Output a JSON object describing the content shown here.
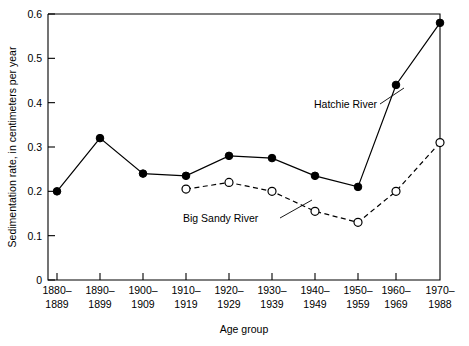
{
  "chart_data": {
    "type": "line",
    "title": "",
    "xlabel": "Age group",
    "ylabel": "Sedimentation rate, in centimeters per year",
    "categories": [
      "1880–1889",
      "1890–1899",
      "1900–1909",
      "1910–1919",
      "1920–1929",
      "1930–1939",
      "1940–1949",
      "1950–1959",
      "1960–1969",
      "1970–1988"
    ],
    "category_lines": [
      [
        "1880–",
        "1889"
      ],
      [
        "1890–",
        "1899"
      ],
      [
        "1900–",
        "1909"
      ],
      [
        "1910–",
        "1919"
      ],
      [
        "1920–",
        "1929"
      ],
      [
        "1930–",
        "1939"
      ],
      [
        "1940–",
        "1949"
      ],
      [
        "1950–",
        "1959"
      ],
      [
        "1960–",
        "1969"
      ],
      [
        "1970–",
        "1988"
      ]
    ],
    "series": [
      {
        "name": "Hatchie River",
        "marker": "filled-circle",
        "line_style": "solid",
        "values": [
          0.2,
          0.32,
          0.24,
          0.235,
          0.28,
          0.275,
          0.235,
          0.21,
          0.44,
          0.58
        ]
      },
      {
        "name": "Big Sandy River",
        "marker": "open-circle",
        "line_style": "dashed",
        "values": [
          null,
          null,
          null,
          0.205,
          0.22,
          0.2,
          0.155,
          0.13,
          0.2,
          0.31
        ]
      }
    ],
    "ylim": [
      0,
      0.6
    ],
    "yticks": [
      0,
      0.1,
      0.2,
      0.3,
      0.4,
      0.5,
      0.6
    ],
    "ytick_labels": [
      "0",
      "0.1",
      "0.2",
      "0.3",
      "0.4",
      "0.5",
      "0.6"
    ],
    "grid": false,
    "legend_position": "inline-annotations",
    "annotations": [
      {
        "text": "Hatchie River",
        "series": "Hatchie River",
        "points_to_category": "1960–1969"
      },
      {
        "text": "Big Sandy River",
        "series": "Big Sandy River",
        "points_to_category": "1940–1949"
      }
    ],
    "colors": {
      "line": "#000000",
      "marker_fill_hatchie": "#000000",
      "marker_fill_bigsandy": "#ffffff",
      "background": "#ffffff"
    }
  }
}
